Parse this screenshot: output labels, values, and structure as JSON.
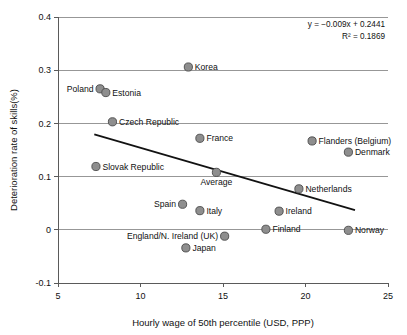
{
  "chart_data": {
    "type": "scatter",
    "title": "",
    "xlabel": "Hourly wage of 50th percentile (USD, PPP)",
    "ylabel": "Deterioration rate of skills(%)",
    "xlim": [
      5,
      25
    ],
    "ylim": [
      -0.1,
      0.4
    ],
    "xticks": [
      "5",
      "10",
      "15",
      "20",
      "25"
    ],
    "xtick_values": [
      5,
      10,
      15,
      20,
      25
    ],
    "yticks": [
      "0.4",
      "0.3",
      "0.2",
      "0.1",
      "0",
      "-0.1"
    ],
    "ytick_values": [
      0.4,
      0.3,
      0.2,
      0.1,
      0,
      -0.1
    ],
    "grid": "horizontal",
    "legend": "none",
    "annotations": {
      "equation": "y = −0.009x + 0.2441",
      "r_squared": "R² = 0.1869"
    },
    "trendline": {
      "slope": -0.009,
      "intercept": 0.2441,
      "x_start": 7.2,
      "x_end": 23.0,
      "y_start": 0.1794,
      "y_end": 0.0371
    },
    "points": [
      {
        "label": "Korea",
        "x": 12.9,
        "y": 0.306,
        "label_pos": "right"
      },
      {
        "label": "Poland",
        "x": 7.55,
        "y": 0.265,
        "label_pos": "left"
      },
      {
        "label": "Estonia",
        "x": 7.9,
        "y": 0.258,
        "label_pos": "right"
      },
      {
        "label": "Czech Republic",
        "x": 8.3,
        "y": 0.203,
        "label_pos": "right"
      },
      {
        "label": "France",
        "x": 13.6,
        "y": 0.172,
        "label_pos": "right"
      },
      {
        "label": "Flanders (Belgium)",
        "x": 20.4,
        "y": 0.167,
        "label_pos": "right"
      },
      {
        "label": "Denmark",
        "x": 22.6,
        "y": 0.146,
        "label_pos": "right"
      },
      {
        "label": "Slovak Republic",
        "x": 7.3,
        "y": 0.119,
        "label_pos": "right"
      },
      {
        "label": "Average",
        "x": 14.6,
        "y": 0.108,
        "label_pos": "below"
      },
      {
        "label": "Netherlands",
        "x": 19.6,
        "y": 0.077,
        "label_pos": "right"
      },
      {
        "label": "Spain",
        "x": 12.55,
        "y": 0.048,
        "label_pos": "left"
      },
      {
        "label": "Italy",
        "x": 13.6,
        "y": 0.036,
        "label_pos": "right"
      },
      {
        "label": "Ireland",
        "x": 18.4,
        "y": 0.035,
        "label_pos": "right"
      },
      {
        "label": "Finland",
        "x": 17.6,
        "y": 0.001,
        "label_pos": "right"
      },
      {
        "label": "Norway",
        "x": 22.6,
        "y": -0.001,
        "label_pos": "right"
      },
      {
        "label": "England/N. Ireland (UK)",
        "x": 15.1,
        "y": -0.012,
        "label_pos": "left"
      },
      {
        "label": "Japan",
        "x": 12.75,
        "y": -0.034,
        "label_pos": "right"
      }
    ],
    "colors": {
      "marker_fill": "#8e8e8e",
      "marker_stroke": "#4a4a4a",
      "trendline": "#121212",
      "gridline": "#8c8c8c",
      "axis": "#5a5a5a",
      "text": "#111111",
      "background": "#ffffff"
    }
  }
}
